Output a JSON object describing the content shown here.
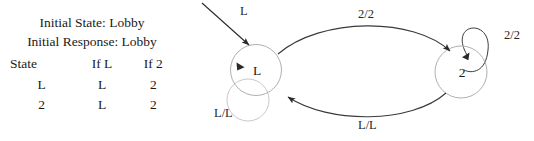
{
  "figure": {
    "type": "finite-state-machine",
    "title": "",
    "colors": {
      "state_circle_stroke": "#b0b0b0",
      "transition_arc_stroke": "#3a3a3a",
      "self_loop_stroke": "#c4c4c4",
      "text": "#1a1a1a",
      "background": "#ffffff"
    }
  },
  "table_panel": {
    "initial_state_line": "Initial State: Lobby",
    "initial_response_line": "Initial Response: Lobby",
    "headers": [
      "State",
      "If L",
      "If 2"
    ],
    "rows": [
      [
        "L",
        "L",
        "2"
      ],
      [
        "2",
        "L",
        "2"
      ]
    ]
  },
  "diagram": {
    "states": [
      {
        "id": "L",
        "label": "L"
      },
      {
        "id": "2",
        "label": "2"
      }
    ],
    "start_arrow_label": "L",
    "transitions": [
      {
        "from": "L",
        "to": "2",
        "label": "2/2",
        "position": "top-arc"
      },
      {
        "from": "2",
        "to": "L",
        "label": "L/L",
        "position": "bottom-arc"
      },
      {
        "from": "L",
        "to": "L",
        "label": "L/L",
        "position": "left-self-loop"
      },
      {
        "from": "2",
        "to": "2",
        "label": "2/2",
        "position": "right-self-loop"
      }
    ]
  }
}
